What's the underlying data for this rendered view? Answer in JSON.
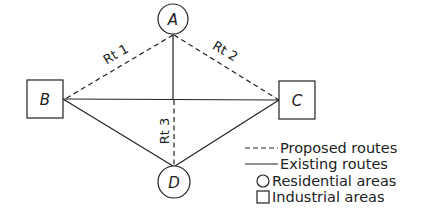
{
  "colors": {
    "ink": "#222222",
    "background": "#ffffff"
  },
  "nodes": [
    {
      "id": "A",
      "label": "A",
      "shape": "circle",
      "type": "Residential area"
    },
    {
      "id": "B",
      "label": "B",
      "shape": "square",
      "type": "Industrial area"
    },
    {
      "id": "C",
      "label": "C",
      "shape": "square",
      "type": "Industrial area"
    },
    {
      "id": "D",
      "label": "D",
      "shape": "circle",
      "type": "Residential area"
    }
  ],
  "edges": [
    {
      "from": "A",
      "to": "B",
      "style": "dashed",
      "label": "Rt 1"
    },
    {
      "from": "A",
      "to": "C",
      "style": "dashed",
      "label": "Rt 2"
    },
    {
      "from": "A",
      "to": "D",
      "style": "dashed",
      "label": "Rt 3",
      "note": "dashed below B–C line, solid above"
    },
    {
      "from": "B",
      "to": "C",
      "style": "solid",
      "label": ""
    },
    {
      "from": "B",
      "to": "D",
      "style": "solid",
      "label": ""
    },
    {
      "from": "C",
      "to": "D",
      "style": "solid",
      "label": ""
    },
    {
      "from": "A",
      "to": "BC-line",
      "style": "solid",
      "label": ""
    }
  ],
  "route_labels": {
    "rt1": "Rt 1",
    "rt2": "Rt 2",
    "rt3": "Rt 3"
  },
  "legend": {
    "items": [
      {
        "symbol": "dashed-line",
        "label": "Proposed routes"
      },
      {
        "symbol": "solid-line",
        "label": "Existing routes"
      },
      {
        "symbol": "circle",
        "label": "Residential areas"
      },
      {
        "symbol": "square",
        "label": "Industrial areas"
      }
    ]
  }
}
